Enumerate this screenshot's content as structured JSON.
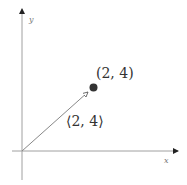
{
  "diagram": {
    "type": "vector-plot",
    "axes": {
      "x_label": "x",
      "y_label": "y",
      "color": "#9a9a9a"
    },
    "point": {
      "label": "(2, 4)",
      "coords": [
        2,
        4
      ],
      "color": "#333333"
    },
    "vector": {
      "label": "⟨2, 4⟩",
      "components": [
        2,
        4
      ],
      "color": "#888888"
    }
  }
}
